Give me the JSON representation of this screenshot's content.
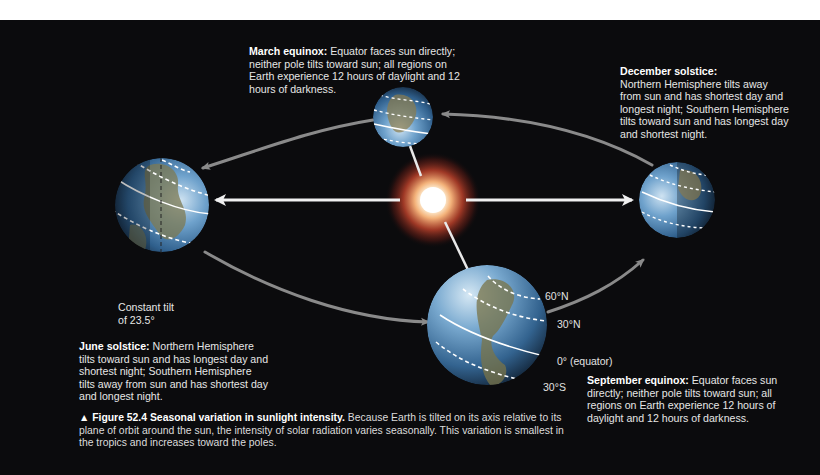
{
  "figure": {
    "number_label": "▲ Figure 52.4",
    "title": "Seasonal variation in sunlight intensity.",
    "body": " Because Earth is tilted on its axis relative to its plane of orbit around the sun, the intensity of solar radiation varies seasonally. This variation is smallest in the tropics and increases toward the poles."
  },
  "seasons": {
    "march": {
      "heading": "March equinox:",
      "text": " Equator faces sun directly; neither pole tilts toward sun; all regions on Earth experience 12 hours of daylight and 12 hours of darkness."
    },
    "december": {
      "heading": "December solstice:",
      "text": " Northern Hemisphere tilts away from sun and has shortest day and longest night; Southern Hemisphere tilts toward sun and has longest day and shortest night."
    },
    "june": {
      "heading": "June solstice:",
      "text": " Northern Hemisphere tilts toward sun and has longest day and shortest night; Southern Hemisphere tilts away from sun and has shortest day and longest night."
    },
    "september": {
      "heading": "September equinox:",
      "text": " Equator faces sun directly; neither pole tilts toward sun; all regions on Earth experience 12 hours of daylight and 12 hours of darkness."
    }
  },
  "tilt_label": {
    "line1": "Constant tilt",
    "line2": "of 23.5°"
  },
  "latitude_labels": {
    "n60": "60°N",
    "n30": "30°N",
    "equator": "0° (equator)",
    "s30": "30°S"
  },
  "colors": {
    "background": "#0b0b0d",
    "orbit_arrow": "#8a8a8a",
    "sun_core": "#ffffff",
    "sun_glow": "#e24a2a",
    "ocean": "#3f7fb5",
    "land": "#8a7a4a",
    "text": "#e6e6e6"
  }
}
